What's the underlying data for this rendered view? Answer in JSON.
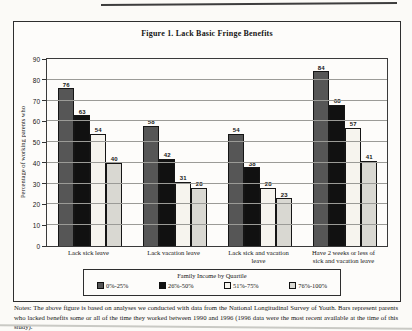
{
  "figure": {
    "title": "Figure 1.  Lack Basic Fringe Benefits"
  },
  "chart_data": {
    "type": "bar",
    "title": "Figure 1.  Lack Basic Fringe Benefits",
    "xlabel": "",
    "ylabel": "Percentage of working parents who",
    "ylim": [
      0,
      90
    ],
    "yticks": [
      0,
      10,
      20,
      30,
      40,
      50,
      60,
      70,
      80,
      90
    ],
    "grid": true,
    "legend_title": "Family Income by Quartile",
    "legend_position": "bottom",
    "categories": [
      "Lack sick leave",
      "Lack vacation leave",
      "Lack sick and vacation leave",
      "Have 2 weeks or less of sick and vacation leave"
    ],
    "series": [
      {
        "name": "0%-25%",
        "color": "#565656",
        "values": [
          76,
          58,
          54,
          84
        ]
      },
      {
        "name": "26%-50%",
        "color": "#111111",
        "values": [
          63,
          42,
          38,
          68
        ]
      },
      {
        "name": "51%-75%",
        "color": "#f6f4ee",
        "values": [
          54,
          31,
          28,
          57
        ]
      },
      {
        "name": "76%-100%",
        "color": "#d9d8d2",
        "values": [
          40,
          28,
          23,
          41
        ]
      }
    ]
  }
}
